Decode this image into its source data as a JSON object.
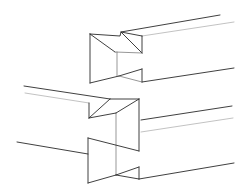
{
  "diagram": {
    "title": "",
    "colors": {
      "background": "#ffffff",
      "line_dark": "#2a2a2a",
      "line_mid": "#6a6a6a",
      "line_light": "#a8a8a8"
    },
    "figures": [
      {
        "name": "upper-joint",
        "label": ""
      },
      {
        "name": "lower-joint",
        "label": ""
      }
    ]
  }
}
